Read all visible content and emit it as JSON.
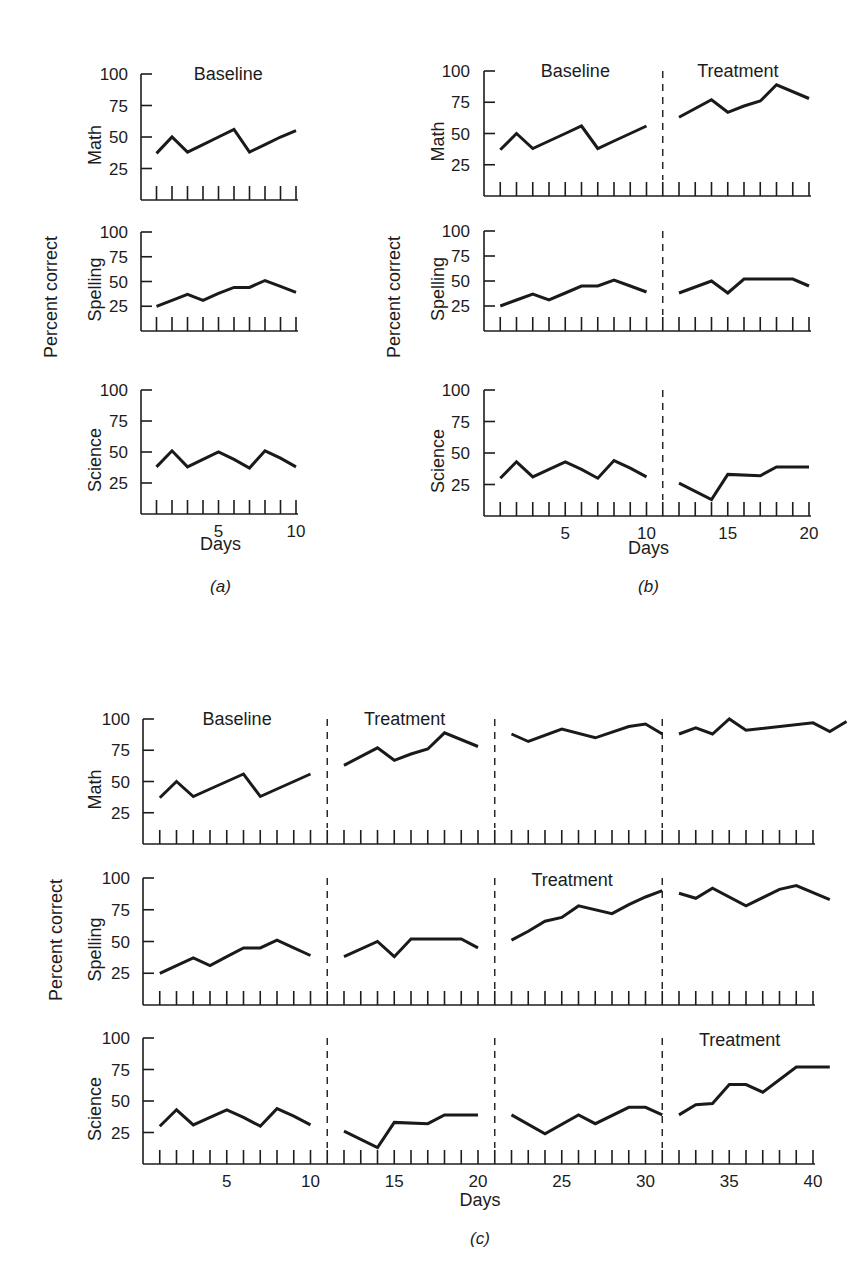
{
  "figure": {
    "y_axis_title": "Percent correct",
    "x_axis_title": "Days",
    "y_ticks": [
      25,
      50,
      75,
      100
    ]
  },
  "chart_data": [
    {
      "type": "line",
      "caption": "(a)",
      "xlabel": "Days",
      "ylabel": "Percent correct",
      "x_ticks_labeled": [
        5,
        10
      ],
      "xlim": [
        0,
        10
      ],
      "ylim": [
        0,
        100
      ],
      "phases": [
        {
          "label": "Baseline",
          "row": "Math",
          "start": 1,
          "end": 10
        }
      ],
      "dividers": [],
      "rows": [
        {
          "name": "Math",
          "segments": [
            {
              "x": [
                1,
                2,
                3,
                4,
                5,
                6,
                7,
                8,
                9,
                10
              ],
              "y": [
                37,
                50,
                38,
                44,
                50,
                56,
                38,
                44,
                50,
                55
              ]
            }
          ]
        },
        {
          "name": "Spelling",
          "segments": [
            {
              "x": [
                1,
                2,
                3,
                4,
                5,
                6,
                7,
                8,
                9,
                10
              ],
              "y": [
                25,
                31,
                37,
                31,
                38,
                44,
                44,
                51,
                45,
                39
              ]
            }
          ]
        },
        {
          "name": "Science",
          "segments": [
            {
              "x": [
                1,
                2,
                3,
                4,
                5,
                6,
                7,
                8,
                9,
                10
              ],
              "y": [
                38,
                51,
                38,
                44,
                50,
                44,
                37,
                51,
                45,
                38
              ]
            }
          ]
        }
      ]
    },
    {
      "type": "line",
      "caption": "(b)",
      "xlabel": "Days",
      "ylabel": "Percent correct",
      "x_ticks_labeled": [
        5,
        10,
        15,
        20
      ],
      "xlim": [
        0,
        20
      ],
      "ylim": [
        0,
        100
      ],
      "phases": [
        {
          "label": "Baseline",
          "row": "Math",
          "start": 1,
          "end": 10
        },
        {
          "label": "Treatment",
          "row": "Math",
          "start": 11,
          "end": 20
        }
      ],
      "dividers": [
        11
      ],
      "rows": [
        {
          "name": "Math",
          "segments": [
            {
              "x": [
                1,
                2,
                3,
                4,
                5,
                6,
                7,
                8,
                9,
                10
              ],
              "y": [
                37,
                50,
                38,
                44,
                50,
                56,
                38,
                44,
                50,
                56
              ]
            },
            {
              "x": [
                12,
                14,
                15,
                16,
                17,
                18,
                20
              ],
              "y": [
                63,
                77,
                67,
                72,
                76,
                89,
                78,
                88
              ]
            }
          ]
        },
        {
          "name": "Spelling",
          "segments": [
            {
              "x": [
                1,
                2,
                3,
                4,
                5,
                6,
                7,
                8,
                9,
                10
              ],
              "y": [
                25,
                31,
                37,
                31,
                38,
                45,
                45,
                51,
                45,
                39
              ]
            },
            {
              "x": [
                12,
                14,
                15,
                16,
                18,
                19,
                20
              ],
              "y": [
                38,
                50,
                38,
                52,
                52,
                52,
                45
              ]
            }
          ]
        },
        {
          "name": "Science",
          "segments": [
            {
              "x": [
                1,
                2,
                3,
                4,
                5,
                6,
                7,
                8,
                9,
                10
              ],
              "y": [
                30,
                43,
                31,
                37,
                43,
                37,
                30,
                44,
                38,
                31
              ]
            },
            {
              "x": [
                12,
                14,
                15,
                17,
                18,
                20
              ],
              "y": [
                26,
                13,
                33,
                32,
                39,
                39
              ]
            }
          ]
        }
      ]
    },
    {
      "type": "line",
      "caption": "(c)",
      "xlabel": "Days",
      "ylabel": "Percent correct",
      "x_ticks_labeled": [
        5,
        10,
        15,
        20,
        25,
        30,
        35,
        40
      ],
      "xlim": [
        0,
        40
      ],
      "ylim": [
        0,
        100
      ],
      "phases": [
        {
          "label": "Baseline",
          "row": "Math",
          "start": 1,
          "end": 10
        },
        {
          "label": "Treatment",
          "row": "Math",
          "start": 11,
          "end": 20
        },
        {
          "label": "Treatment",
          "row": "Spelling",
          "start": 21,
          "end": 30
        },
        {
          "label": "Treatment",
          "row": "Science",
          "start": 31,
          "end": 40
        }
      ],
      "dividers": [
        11,
        21,
        31
      ],
      "rows": [
        {
          "name": "Math",
          "segments": [
            {
              "x": [
                1,
                2,
                3,
                4,
                5,
                6,
                7,
                8,
                9,
                10
              ],
              "y": [
                37,
                50,
                38,
                44,
                50,
                56,
                38,
                44,
                50,
                56
              ]
            },
            {
              "x": [
                12,
                14,
                15,
                16,
                17,
                18,
                20
              ],
              "y": [
                63,
                77,
                67,
                72,
                76,
                89,
                78,
                88
              ]
            },
            {
              "x": [
                22,
                23,
                25,
                27,
                29,
                30,
                31
              ],
              "y": [
                88,
                82,
                92,
                85,
                94,
                96,
                88
              ]
            },
            {
              "x": [
                32,
                33,
                34,
                35,
                36,
                40,
                41,
                42
              ],
              "y": [
                88,
                93,
                88,
                100,
                91,
                97,
                90,
                98
              ]
            }
          ]
        },
        {
          "name": "Spelling",
          "segments": [
            {
              "x": [
                1,
                2,
                3,
                4,
                5,
                6,
                7,
                8,
                9,
                10
              ],
              "y": [
                25,
                31,
                37,
                31,
                38,
                45,
                45,
                51,
                45,
                39
              ]
            },
            {
              "x": [
                12,
                14,
                15,
                16,
                18,
                19,
                20
              ],
              "y": [
                38,
                50,
                38,
                52,
                52,
                52,
                45
              ]
            },
            {
              "x": [
                22,
                23,
                24,
                25,
                26,
                28,
                29,
                30,
                31
              ],
              "y": [
                51,
                58,
                66,
                69,
                78,
                72,
                79,
                85,
                90
              ]
            },
            {
              "x": [
                32,
                33,
                34,
                36,
                38,
                39,
                41
              ],
              "y": [
                88,
                84,
                92,
                78,
                91,
                94,
                83
              ]
            }
          ]
        },
        {
          "name": "Science",
          "segments": [
            {
              "x": [
                1,
                2,
                3,
                4,
                5,
                6,
                7,
                8,
                9,
                10
              ],
              "y": [
                30,
                43,
                31,
                37,
                43,
                37,
                30,
                44,
                38,
                31
              ]
            },
            {
              "x": [
                12,
                14,
                15,
                17,
                18,
                20
              ],
              "y": [
                26,
                13,
                33,
                32,
                39,
                39
              ]
            },
            {
              "x": [
                22,
                24,
                26,
                27,
                29,
                30,
                31
              ],
              "y": [
                39,
                24,
                39,
                32,
                45,
                45,
                39
              ]
            },
            {
              "x": [
                32,
                33,
                34,
                35,
                36,
                37,
                39,
                41
              ],
              "y": [
                39,
                47,
                48,
                63,
                63,
                57,
                77,
                77
              ]
            }
          ]
        }
      ]
    }
  ]
}
